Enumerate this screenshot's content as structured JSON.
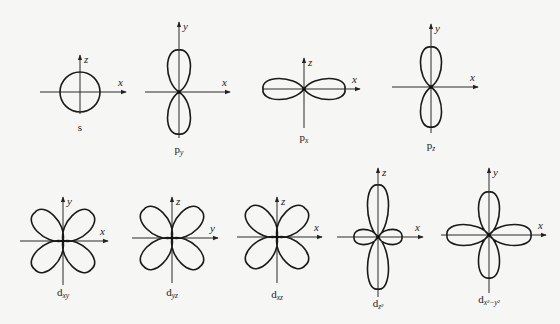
{
  "figure": {
    "background": "#f6f6f4",
    "stroke_color": "#1a1a1a"
  },
  "orbitals": [
    {
      "id": "s",
      "label_main": "s",
      "label_sub": "",
      "center": [
        80,
        92
      ],
      "shape": "circle",
      "r": 20,
      "axes": {
        "h": [
          40,
          126
        ],
        "v": [
          55,
          114
        ],
        "h_label": "x",
        "v_label": "z"
      }
    },
    {
      "id": "py",
      "label_main": "p",
      "label_sub": "y",
      "center": [
        179,
        92
      ],
      "shape": "p-vertical",
      "r": 42,
      "w": 12,
      "axes": {
        "h": [
          145,
          230
        ],
        "v": [
          22,
          138
        ],
        "h_label": "x",
        "v_label": "y"
      }
    },
    {
      "id": "px",
      "label_main": "p",
      "label_sub": "x",
      "center": [
        304,
        89
      ],
      "shape": "p-horizontal",
      "r": 41,
      "w": 11,
      "axes": {
        "h": [
          262,
          360
        ],
        "v": [
          58,
          128
        ],
        "h_label": "x",
        "v_label": "z"
      }
    },
    {
      "id": "pz",
      "label_main": "p",
      "label_sub": "z",
      "center": [
        431,
        87
      ],
      "shape": "p-vertical",
      "r": 40,
      "w": 11,
      "axes": {
        "h": [
          392,
          478
        ],
        "v": [
          24,
          133
        ],
        "h_label": "x",
        "v_label": "y"
      }
    },
    {
      "id": "dxy",
      "label_main": "d",
      "label_sub": "xy",
      "center": [
        63,
        241
      ],
      "shape": "d-diagonal",
      "r": 40,
      "w": 12,
      "axes": {
        "h": [
          20,
          108
        ],
        "v": [
          197,
          285
        ],
        "h_label": "x",
        "v_label": "y"
      }
    },
    {
      "id": "dyz",
      "label_main": "d",
      "label_sub": "yz",
      "center": [
        172,
        238
      ],
      "shape": "d-diagonal",
      "r": 40,
      "w": 12,
      "axes": {
        "h": [
          132,
          218
        ],
        "v": [
          197,
          283
        ],
        "h_label": "y",
        "v_label": "z"
      }
    },
    {
      "id": "dxz",
      "label_main": "d",
      "label_sub": "xz",
      "center": [
        277,
        237
      ],
      "shape": "d-diagonal",
      "r": 40,
      "w": 12,
      "axes": {
        "h": [
          237,
          322
        ],
        "v": [
          197,
          283
        ],
        "h_label": "x",
        "v_label": "z"
      }
    },
    {
      "id": "dz2",
      "label_main": "d",
      "label_sub": "z²",
      "center": [
        378,
        237
      ],
      "shape": "dz2",
      "r": 52,
      "w": 11,
      "r_small": 24,
      "axes": {
        "h": [
          337,
          423
        ],
        "v": [
          168,
          297
        ],
        "h_label": "x",
        "v_label": "z"
      }
    },
    {
      "id": "dx2y2",
      "label_main": "d",
      "label_sub": "x²−y²",
      "center": [
        489,
        235
      ],
      "shape": "d-cross",
      "r_h": 42,
      "r_v": 43,
      "w": 11,
      "axes": {
        "h": [
          441,
          546
        ],
        "v": [
          168,
          293
        ],
        "h_label": "x",
        "v_label": "y"
      }
    }
  ],
  "labels": {
    "s": {
      "main": "s",
      "sub": "",
      "pos": [
        80,
        131
      ]
    },
    "py": {
      "main": "p",
      "sub": "y",
      "pos": [
        179,
        153
      ]
    },
    "px": {
      "main": "p",
      "sub": "x",
      "pos": [
        304,
        141
      ]
    },
    "pz": {
      "main": "p",
      "sub": "z",
      "pos": [
        431,
        149
      ]
    },
    "dxy": {
      "main": "d",
      "sub": "xy",
      "pos": [
        63,
        296
      ]
    },
    "dyz": {
      "main": "d",
      "sub": "yz",
      "pos": [
        172,
        296
      ]
    },
    "dxz": {
      "main": "d",
      "sub": "xz",
      "pos": [
        277,
        298
      ]
    },
    "dz2": {
      "main": "d",
      "sub": "z²",
      "pos": [
        378,
        307
      ]
    },
    "dx2y2": {
      "main": "d",
      "sub": "x²−y²",
      "pos": [
        489,
        303
      ]
    }
  }
}
